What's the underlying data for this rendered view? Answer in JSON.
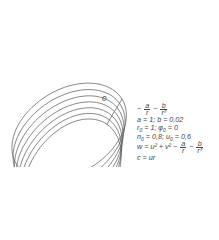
{
  "diagram": {
    "type": "precessing-orbit",
    "origin_label": "0",
    "orbit": {
      "loops": 7,
      "color": "#555555"
    }
  },
  "formulas": {
    "potential": {
      "prefix": "−",
      "t1_num": "a",
      "t1_den": "r",
      "minus": "−",
      "t2_num": "b",
      "t2_den": "r³"
    },
    "line1": "a = 1; b = 0,02",
    "line2_a": "r",
    "line2_a_sub": "0",
    "line2_b": " = 1; φ",
    "line2_b_sub": "0",
    "line2_c": " = 0",
    "line3_a": "n",
    "line3_a_sub": "0",
    "line3_b": " = 0,8; u",
    "line3_b_sub": "0",
    "line3_c": " = 0,6",
    "line4_prefix": "w = u² + v² −",
    "line4_t1_num": "a",
    "line4_t1_den": "r",
    "line4_minus": "−",
    "line4_t2_num": "b",
    "line4_t2_den": "r³",
    "line5": "c = ur"
  }
}
